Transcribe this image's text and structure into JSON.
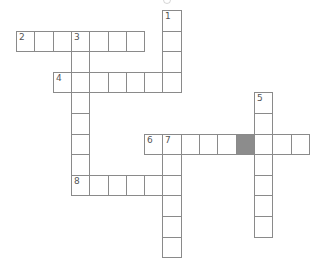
{
  "puzzle": {
    "type": "crossword",
    "grid": {
      "origin_x": 16,
      "origin_y": 10,
      "cell_w": 18.3,
      "cell_h": 20.6
    },
    "colors": {
      "line": "#8a8a8a",
      "block": "#8c8c8c",
      "number": "#555555"
    },
    "entries": [
      {
        "number": "1",
        "direction": "down",
        "row": 0,
        "col": 8,
        "length": 4
      },
      {
        "number": "2",
        "direction": "across",
        "row": 1,
        "col": 0,
        "length": 7
      },
      {
        "number": "3",
        "direction": "down",
        "row": 1,
        "col": 3,
        "length": 8
      },
      {
        "number": "4",
        "direction": "across",
        "row": 3,
        "col": 2,
        "length": 7
      },
      {
        "number": "5",
        "direction": "down",
        "row": 4,
        "col": 13,
        "length": 7
      },
      {
        "number": "6",
        "direction": "across",
        "row": 6,
        "col": 7,
        "length": 9
      },
      {
        "number": "7",
        "direction": "down",
        "row": 6,
        "col": 8,
        "length": 6
      },
      {
        "number": "8",
        "direction": "across",
        "row": 8,
        "col": 3,
        "length": 6
      }
    ],
    "blocks": [
      {
        "row": 6,
        "col": 12
      }
    ]
  }
}
